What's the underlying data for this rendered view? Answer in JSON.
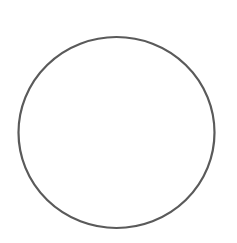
{
  "canvas": {
    "width": 237,
    "height": 243,
    "background": "#ffffff"
  },
  "shapes": [
    {
      "type": "circle",
      "cx": 116.5,
      "cy": 132.5,
      "rx": 98,
      "ry": 95.5,
      "stroke": "#5a5a5a",
      "stroke_width": 2.2,
      "fill": "none"
    }
  ]
}
